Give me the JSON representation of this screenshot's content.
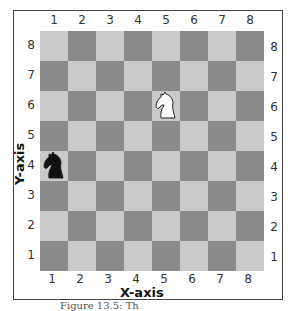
{
  "figure": {
    "x_axis_label": "X-axis",
    "y_axis_label": "Y-axis",
    "caption": "Figure 13.5: Th",
    "columns": [
      "1",
      "2",
      "3",
      "4",
      "5",
      "6",
      "7",
      "8"
    ],
    "rows": [
      "8",
      "7",
      "6",
      "5",
      "4",
      "3",
      "2",
      "1"
    ],
    "colors": {
      "light_square": "#c9c9c9",
      "dark_square": "#8a8a8a",
      "frame": "#444444"
    },
    "pieces": [
      {
        "name": "white-knight",
        "x": 5,
        "y": 6,
        "color": "white"
      },
      {
        "name": "black-knight",
        "x": 1,
        "y": 4,
        "color": "black"
      }
    ]
  }
}
